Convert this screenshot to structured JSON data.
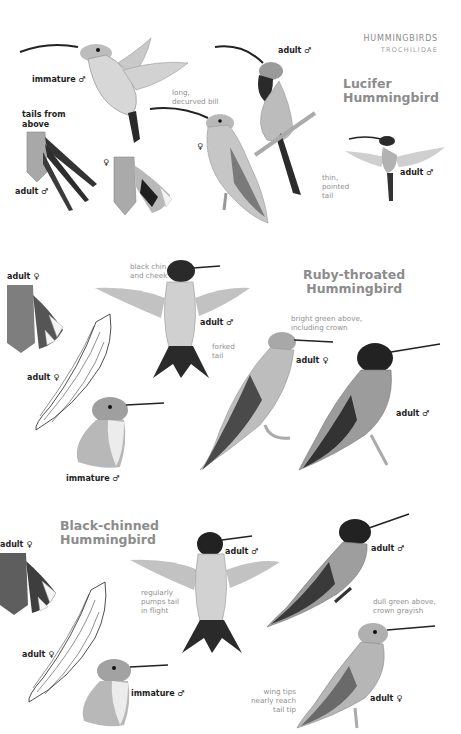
{
  "header": {
    "family": "HUMMINGBIRDS",
    "scientific": "TROCHILIDAE"
  },
  "species": [
    {
      "name_line1": "Lucifer",
      "name_line2": "Hummingbird",
      "labels": {
        "immature_male": "immature ♂",
        "tails_line1": "tails from",
        "tails_line2": "above",
        "tail_adult_male": "adult ♂",
        "tail_female": "♀",
        "perched_female": "♀",
        "perched_male": "adult ♂",
        "flying_male": "adult ♂"
      },
      "notes": {
        "bill_line1": "long,",
        "bill_line2": "decurved bill",
        "tail_line1": "thin,",
        "tail_line2": "pointed",
        "tail_line3": "tail"
      }
    },
    {
      "name_line1": "Ruby-throated",
      "name_line2": "Hummingbird",
      "labels": {
        "tail_adult_female": "adult ♀",
        "wing_adult_female": "adult ♀",
        "flying_male": "adult ♂",
        "perched_female": "adult ♀",
        "perched_male": "adult ♂",
        "immature_male": "immature ♂"
      },
      "notes": {
        "chin_line1": "black chin",
        "chin_line2": "and cheek",
        "tail_line1": "forked",
        "tail_line2": "tail",
        "crown_line1": "bright green above,",
        "crown_line2": "including crown"
      }
    },
    {
      "name_line1": "Black-chinned",
      "name_line2": "Hummingbird",
      "labels": {
        "tail_adult_female": "adult ♀",
        "wing_adult_female": "adult ♀",
        "flying_male": "adult ♂",
        "immature_male": "immature ♂",
        "perched_male": "adult ♂",
        "perched_female": "adult ♀"
      },
      "notes": {
        "pumps_line1": "regularly",
        "pumps_line2": "pumps tail",
        "pumps_line3": "in flight",
        "crown_line1": "dull green above,",
        "crown_line2": "crown grayish",
        "wing_line1": "wing tips",
        "wing_line2": "nearly reach",
        "wing_line3": "tail tip"
      }
    }
  ],
  "colors": {
    "title_gray": "#8c8c8c",
    "note_gray": "#8f8f8f",
    "label_black": "#1e1e1e",
    "illustration_dark": "#2a2a2a",
    "illustration_mid": "#8a8a8a",
    "illustration_light": "#d9d9d9"
  }
}
